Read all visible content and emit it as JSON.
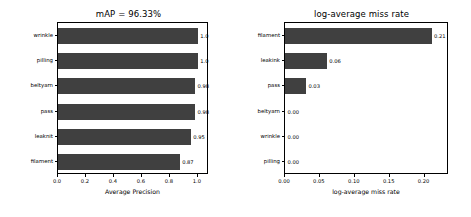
{
  "figure": {
    "width": 471,
    "height": 217,
    "background": "#ffffff",
    "bar_color": "#404040",
    "axis_color": "#000000"
  },
  "chart_data": [
    {
      "type": "bar",
      "orientation": "horizontal",
      "panel": "left",
      "title": "mAP = 96.33%",
      "xlabel": "Average Precision",
      "ylabel": "",
      "categories": [
        "wrinkle",
        "pilling",
        "beltyarn",
        "pass",
        "leaknit",
        "filament"
      ],
      "values": [
        1.0,
        1.0,
        0.98,
        0.98,
        0.95,
        0.87
      ],
      "value_labels": [
        "1.0",
        "1.0",
        "0.98",
        "0.98",
        "0.95",
        "0.87"
      ],
      "xlim": [
        0.0,
        1.08
      ],
      "xticks": [
        0.0,
        0.2,
        0.4,
        0.6,
        0.8,
        1.0
      ],
      "xticklabels": [
        "0.0",
        "0.2",
        "0.4",
        "0.6",
        "0.8",
        "1.0"
      ],
      "grid": false,
      "legend": "none"
    },
    {
      "type": "bar",
      "orientation": "horizontal",
      "panel": "right",
      "title": "log-average miss rate",
      "xlabel": "log-average miss rate",
      "ylabel": "",
      "categories": [
        "filament",
        "leakink",
        "pass",
        "beltyarn",
        "wrinkle",
        "pilling"
      ],
      "values": [
        0.21,
        0.06,
        0.03,
        0.0,
        0.0,
        0.0
      ],
      "value_labels": [
        "0.21",
        "0.06",
        "0.03",
        "0.00",
        "0.00",
        "0.00"
      ],
      "xlim": [
        0.0,
        0.235
      ],
      "xticks": [
        0.0,
        0.05,
        0.1,
        0.15,
        0.2
      ],
      "xticklabels": [
        "0.00",
        "0.05",
        "0.10",
        "0.15",
        "0.20"
      ],
      "grid": false,
      "legend": "none"
    }
  ]
}
